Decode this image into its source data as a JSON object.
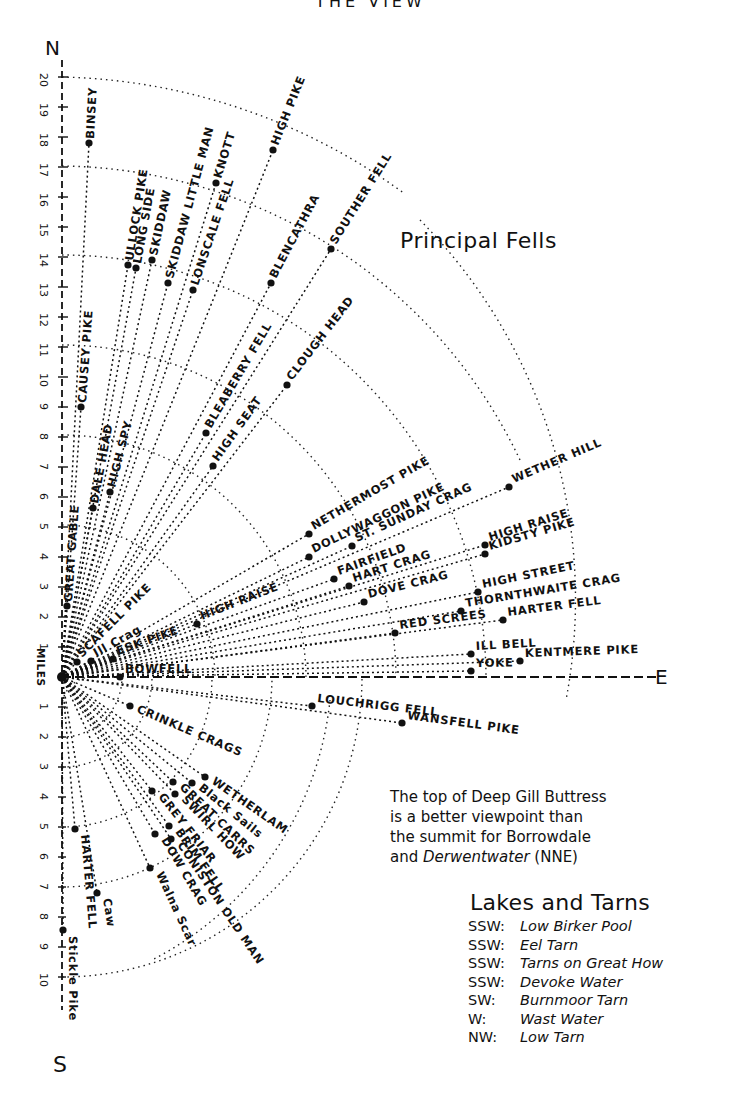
{
  "header": {
    "title": "THE VIEW"
  },
  "compass": {
    "north": "N",
    "south": "S",
    "east": "E"
  },
  "scale": {
    "unit_label": "MILES",
    "north_ticks": [
      "1",
      "2",
      "3",
      "4",
      "5",
      "6",
      "7",
      "8",
      "9",
      "10",
      "11",
      "12",
      "13",
      "14",
      "15",
      "16",
      "17",
      "18",
      "19",
      "20"
    ],
    "south_ticks": [
      "1",
      "2",
      "3",
      "4",
      "5",
      "6",
      "7",
      "8",
      "9",
      "10"
    ]
  },
  "title": "Principal Fells",
  "fells_north": [
    {
      "name": "BINSEY",
      "x": 89,
      "y": 143
    },
    {
      "name": "ULLOCK PIKE",
      "x": 128,
      "y": 265
    },
    {
      "name": "LONG SIDE",
      "x": 136,
      "y": 268
    },
    {
      "name": "SKIDDAW",
      "x": 152,
      "y": 260
    },
    {
      "name": "SKIDDAW LITTLE MAN",
      "x": 168,
      "y": 283
    },
    {
      "name": "KNOTT",
      "x": 216,
      "y": 183
    },
    {
      "name": "LONSCALE FELL",
      "x": 193,
      "y": 290
    },
    {
      "name": "HIGH PIKE",
      "x": 273,
      "y": 150
    },
    {
      "name": "BLENCATHRA",
      "x": 271,
      "y": 283
    },
    {
      "name": "SOUTHER FELL",
      "x": 331,
      "y": 249
    },
    {
      "name": "CAUSEY PIKE",
      "x": 81,
      "y": 407
    },
    {
      "name": "BLEABERRY FELL",
      "x": 206,
      "y": 433
    },
    {
      "name": "CLOUGH HEAD",
      "x": 287,
      "y": 385
    },
    {
      "name": "DALE HEAD",
      "x": 93,
      "y": 508
    },
    {
      "name": "HIGH SPY",
      "x": 110,
      "y": 492
    },
    {
      "name": "HIGH SEAT",
      "x": 213,
      "y": 466
    },
    {
      "name": "GREAT GABLE",
      "x": 67,
      "y": 606
    },
    {
      "name": "SCAFELL PIKE",
      "x": 77,
      "y": 662
    },
    {
      "name": "Ill Crag",
      "x": 91,
      "y": 661
    },
    {
      "name": "ESK PIKE",
      "x": 113,
      "y": 659
    },
    {
      "name": "HIGH RAISE",
      "x": 197,
      "y": 624
    },
    {
      "name": "BOWFELL",
      "x": 120,
      "y": 677
    }
  ],
  "fells_east": [
    {
      "name": "NETHERMOST PIKE",
      "x": 309,
      "y": 534
    },
    {
      "name": "DOLLYWAGGON PIKE",
      "x": 309,
      "y": 557
    },
    {
      "name": "ST. SUNDAY CRAG",
      "x": 352,
      "y": 546
    },
    {
      "name": "WETHER HILL",
      "x": 509,
      "y": 487
    },
    {
      "name": "FAIRFIELD",
      "x": 334,
      "y": 579
    },
    {
      "name": "HART CRAG",
      "x": 349,
      "y": 586
    },
    {
      "name": "HIGH RAISE",
      "x": 485,
      "y": 545
    },
    {
      "name": "KIDSTY PIKE",
      "x": 485,
      "y": 554
    },
    {
      "name": "DOVE CRAG",
      "x": 364,
      "y": 602
    },
    {
      "name": "HIGH STREET",
      "x": 478,
      "y": 592
    },
    {
      "name": "THORNTHWAITE CRAG",
      "x": 461,
      "y": 611
    },
    {
      "name": "RED SCREES",
      "x": 395,
      "y": 633
    },
    {
      "name": "HARTER FELL",
      "x": 503,
      "y": 620
    },
    {
      "name": "ILL BELL",
      "x": 471,
      "y": 654
    },
    {
      "name": "KENTMERE PIKE",
      "x": 520,
      "y": 661
    },
    {
      "name": "YOKE",
      "x": 471,
      "y": 671
    },
    {
      "name": "LOUCHRIGG FELL",
      "x": 312,
      "y": 706
    },
    {
      "name": "WANSFELL PIKE",
      "x": 402,
      "y": 723
    }
  ],
  "fells_south": [
    {
      "name": "CRINKLE CRAGS",
      "x": 130,
      "y": 706
    },
    {
      "name": "WETHERLAM",
      "x": 205,
      "y": 777
    },
    {
      "name": "Black Sails",
      "x": 192,
      "y": 783
    },
    {
      "name": "GREAT CARRS",
      "x": 173,
      "y": 782
    },
    {
      "name": "SWIRL HOW",
      "x": 175,
      "y": 794
    },
    {
      "name": "GREY FRIAR",
      "x": 152,
      "y": 791
    },
    {
      "name": "BRIM FELL",
      "x": 169,
      "y": 826
    },
    {
      "name": "CONISTON OLD MAN",
      "x": 171,
      "y": 839
    },
    {
      "name": "DOW CRAG",
      "x": 155,
      "y": 834
    },
    {
      "name": "Walna Scar",
      "x": 150,
      "y": 868
    },
    {
      "name": "HARTER FELL",
      "x": 75,
      "y": 829
    },
    {
      "name": "Caw",
      "x": 97,
      "y": 893
    },
    {
      "name": "Stickle Pike",
      "x": 63,
      "y": 930
    }
  ],
  "note": {
    "line1_a": "The top of Deep Gill Buttress",
    "line2": "is a better viewpoint than",
    "line3": "the summit for Borrowdale",
    "line4_a": "and ",
    "line4_it": "Derwentwater",
    "line4_b": " (NNE)"
  },
  "lakes": {
    "title": "Lakes and Tarns",
    "items": [
      {
        "dir": "SSW:",
        "name": "Low Birker Pool"
      },
      {
        "dir": "SSW:",
        "name": "Eel Tarn"
      },
      {
        "dir": "SSW:",
        "name": "Tarns on Great How"
      },
      {
        "dir": "SSW:",
        "name": "Devoke Water"
      },
      {
        "dir": "SW:",
        "name": "Burnmoor Tarn"
      },
      {
        "dir": "W:",
        "name": "Wast Water"
      },
      {
        "dir": "NW:",
        "name": "Low Tarn"
      }
    ]
  },
  "colors": {
    "ink": "#111111",
    "paper": "#ffffff"
  }
}
